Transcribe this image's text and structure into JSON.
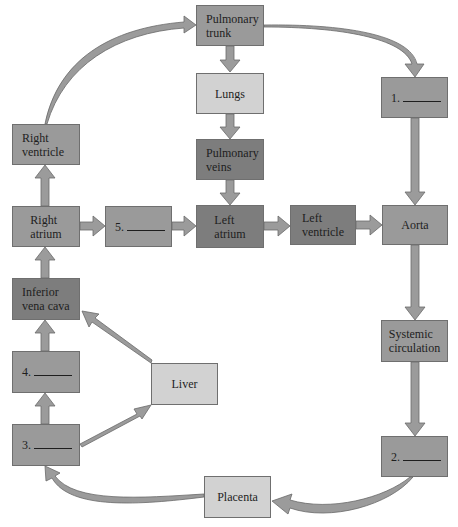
{
  "diagram": {
    "type": "fetal circulation flow diagram",
    "colors": {
      "box_medium": "#9a9a9a",
      "box_dark": "#7d7d7d",
      "box_light": "#d2d2d2",
      "arrow_fill": "#9b9b9b",
      "arrow_stroke": "#6a6a6a"
    },
    "nodes": {
      "pulmonary_trunk": {
        "line1": "Pulmonary",
        "line2": "trunk"
      },
      "lungs": {
        "label": "Lungs"
      },
      "pulmonary_veins": {
        "line1": "Pulmonary",
        "line2": "veins"
      },
      "left_atrium": {
        "line1": "Left",
        "line2": "atrium"
      },
      "left_ventricle": {
        "line1": "Left",
        "line2": "ventricle"
      },
      "aorta": {
        "label": "Aorta"
      },
      "blank_1": {
        "number": "1."
      },
      "right_ventricle": {
        "line1": "Right",
        "line2": "ventricle"
      },
      "right_atrium": {
        "line1": "Right",
        "line2": "atrium"
      },
      "blank_5": {
        "number": "5."
      },
      "inferior_vena_cava": {
        "line1": "Inferior",
        "line2": "vena cava"
      },
      "blank_4": {
        "number": "4."
      },
      "blank_3": {
        "number": "3."
      },
      "liver": {
        "label": "Liver"
      },
      "systemic_circulation": {
        "line1": "Systemic",
        "line2": "circulation"
      },
      "blank_2": {
        "number": "2."
      },
      "placenta": {
        "label": "Placenta"
      }
    },
    "edges": [
      [
        "Right ventricle",
        "Pulmonary trunk"
      ],
      [
        "Pulmonary trunk",
        "Lungs"
      ],
      [
        "Pulmonary trunk",
        "1."
      ],
      [
        "Lungs",
        "Pulmonary veins"
      ],
      [
        "Pulmonary veins",
        "Left atrium"
      ],
      [
        "Right atrium",
        "Right ventricle"
      ],
      [
        "Right atrium",
        "5."
      ],
      [
        "5.",
        "Left atrium"
      ],
      [
        "Left atrium",
        "Left ventricle"
      ],
      [
        "Left ventricle",
        "Aorta"
      ],
      [
        "1.",
        "Aorta"
      ],
      [
        "Aorta",
        "Systemic circulation"
      ],
      [
        "Systemic circulation",
        "2."
      ],
      [
        "2.",
        "Placenta"
      ],
      [
        "Placenta",
        "3."
      ],
      [
        "3.",
        "4."
      ],
      [
        "3.",
        "Liver"
      ],
      [
        "4.",
        "Inferior vena cava"
      ],
      [
        "Liver",
        "Inferior vena cava"
      ],
      [
        "Inferior vena cava",
        "Right atrium"
      ]
    ]
  }
}
